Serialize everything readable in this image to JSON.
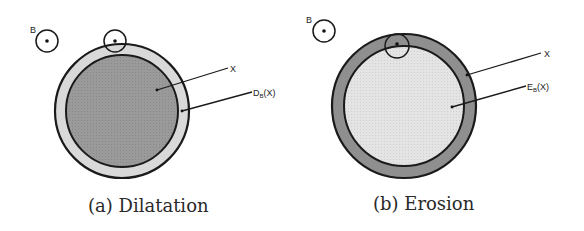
{
  "figure": {
    "panels": [
      {
        "id": "a",
        "caption": "(a) Dilatation",
        "structuring_element_label": "B",
        "labels": {
          "set": "X",
          "result": "D",
          "result_sub": "B",
          "result_arg": "(X)"
        },
        "colors": {
          "inner_fill": "#9a9a9a",
          "ring_fill": "#d9d9d9",
          "stroke": "#1a1a1a"
        }
      },
      {
        "id": "b",
        "caption": "(b) Erosion",
        "structuring_element_label": "B",
        "labels": {
          "set": "X",
          "result": "E",
          "result_sub": "B",
          "result_arg": "(X)"
        },
        "colors": {
          "inner_fill": "#e2e2e2",
          "ring_fill": "#8f8f8f",
          "stroke": "#1a1a1a"
        }
      }
    ]
  }
}
